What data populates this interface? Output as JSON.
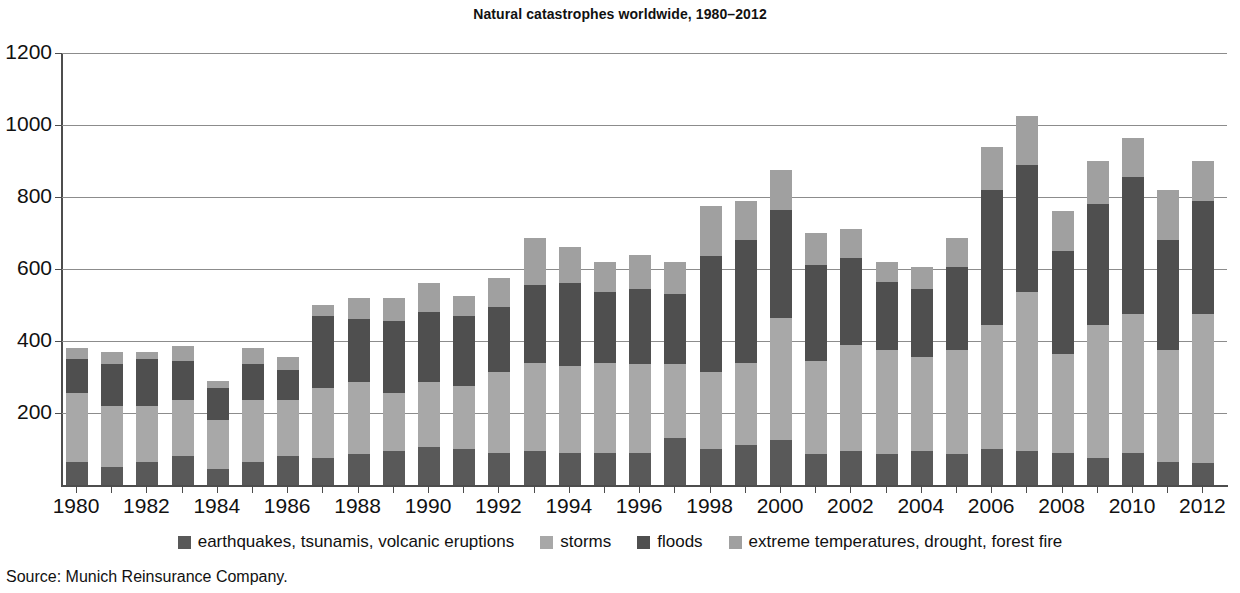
{
  "chart_data": {
    "type": "bar",
    "stacked": true,
    "title": "Natural catastrophes worldwide, 1980–2012",
    "xlabel": "",
    "ylabel": "",
    "ylim": [
      0,
      1200
    ],
    "yticks": [
      200,
      400,
      600,
      800,
      1000,
      1200
    ],
    "grid": true,
    "legend_position": "bottom",
    "source": "Source: Munich Reinsurance Company.",
    "categories": [
      1980,
      1981,
      1982,
      1983,
      1984,
      1985,
      1986,
      1987,
      1988,
      1989,
      1990,
      1991,
      1992,
      1993,
      1994,
      1995,
      1996,
      1997,
      1998,
      1999,
      2000,
      2001,
      2002,
      2003,
      2004,
      2005,
      2006,
      2007,
      2008,
      2009,
      2010,
      2011,
      2012
    ],
    "tick_labels": [
      "1980",
      "",
      "1982",
      "",
      "1984",
      "",
      "1986",
      "",
      "1988",
      "",
      "1990",
      "",
      "1992",
      "",
      "1994",
      "",
      "1996",
      "",
      "1998",
      "",
      "2000",
      "",
      "2002",
      "",
      "2004",
      "",
      "2006",
      "",
      "2008",
      "",
      "2010",
      "",
      "2012"
    ],
    "series": [
      {
        "name": "earthquakes, tsunamis, volcanic eruptions",
        "color": "#595959",
        "values": [
          65,
          50,
          65,
          80,
          45,
          65,
          80,
          75,
          85,
          95,
          105,
          100,
          90,
          95,
          90,
          90,
          90,
          130,
          100,
          110,
          125,
          85,
          95,
          85,
          95,
          85,
          100,
          95,
          90,
          75,
          90,
          65,
          60
        ]
      },
      {
        "name": "storms",
        "color": "#a8a8a8",
        "values": [
          190,
          170,
          155,
          155,
          135,
          170,
          155,
          195,
          200,
          160,
          180,
          175,
          225,
          245,
          240,
          250,
          245,
          205,
          215,
          230,
          340,
          260,
          295,
          290,
          260,
          290,
          345,
          440,
          275,
          370,
          385,
          310,
          415
        ]
      },
      {
        "name": "floods",
        "color": "#4f4f4f",
        "values": [
          95,
          115,
          130,
          110,
          90,
          100,
          85,
          200,
          175,
          200,
          195,
          195,
          180,
          215,
          230,
          195,
          210,
          195,
          320,
          340,
          300,
          265,
          240,
          190,
          190,
          230,
          375,
          355,
          285,
          335,
          380,
          305,
          315
        ]
      },
      {
        "name": "extreme temperatures, drought, forest fire",
        "color": "#a0a0a0",
        "values": [
          30,
          35,
          20,
          40,
          20,
          45,
          35,
          30,
          60,
          65,
          80,
          55,
          80,
          130,
          100,
          85,
          95,
          90,
          140,
          110,
          110,
          90,
          80,
          55,
          60,
          80,
          120,
          135,
          110,
          120,
          110,
          140,
          110
        ]
      }
    ],
    "totals": [
      380,
      370,
      370,
      385,
      290,
      380,
      355,
      500,
      520,
      520,
      560,
      525,
      575,
      685,
      660,
      620,
      640,
      620,
      775,
      790,
      875,
      700,
      710,
      620,
      605,
      685,
      940,
      1025,
      760,
      900,
      965,
      820,
      900
    ]
  },
  "legend": {
    "items": [
      {
        "label": "earthquakes, tsunamis, volcanic eruptions",
        "color": "#595959"
      },
      {
        "label": "storms",
        "color": "#a8a8a8"
      },
      {
        "label": "floods",
        "color": "#4f4f4f"
      },
      {
        "label": "extreme temperatures, drought, forest fire",
        "color": "#a0a0a0"
      }
    ]
  }
}
